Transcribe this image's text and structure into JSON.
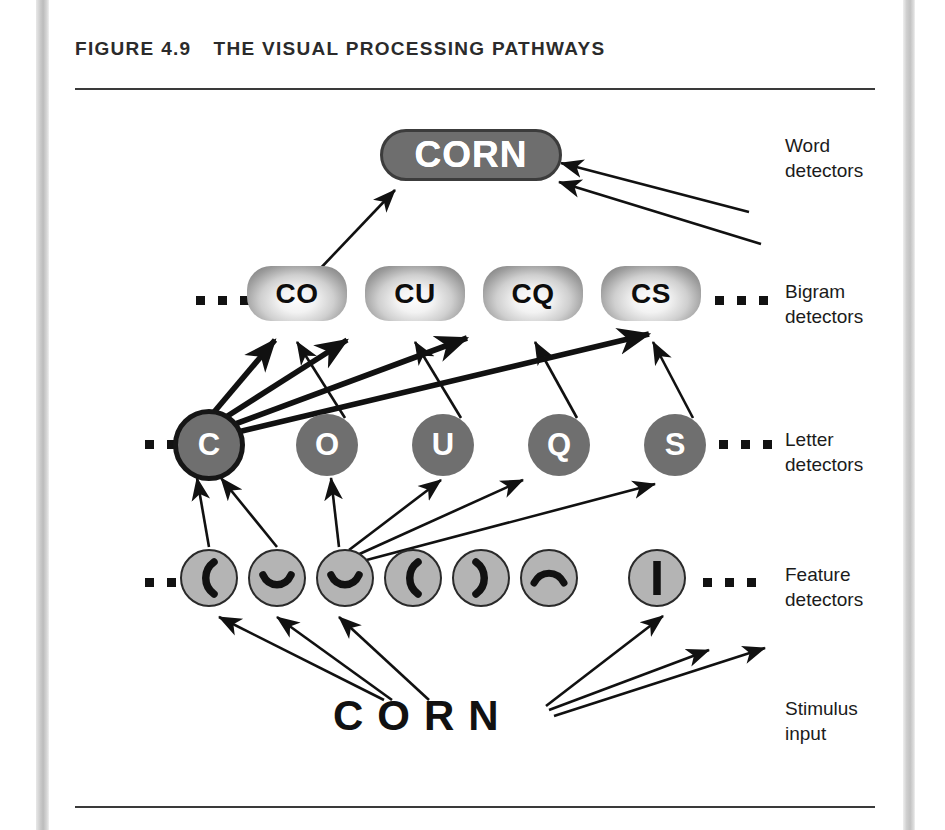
{
  "figure": {
    "number": "FIGURE 4.9",
    "title": "THE VISUAL PROCESSING PATHWAYS"
  },
  "rows": {
    "word": {
      "label": "Word\ndetectors",
      "nodes": [
        {
          "text": "CORN"
        }
      ]
    },
    "bigram": {
      "label": "Bigram\ndetectors",
      "ellipsis_left": "...",
      "ellipsis_right": "...",
      "nodes": [
        {
          "text": "CO"
        },
        {
          "text": "CU"
        },
        {
          "text": "CQ"
        },
        {
          "text": "CS"
        }
      ]
    },
    "letter": {
      "label": "Letter\ndetectors",
      "ellipsis_left": "...",
      "ellipsis_right": "...",
      "nodes": [
        {
          "text": "C",
          "highlight": true
        },
        {
          "text": "O",
          "highlight": false
        },
        {
          "text": "U",
          "highlight": false
        },
        {
          "text": "Q",
          "highlight": false
        },
        {
          "text": "S",
          "highlight": false
        }
      ]
    },
    "feature": {
      "label": "Feature\ndetectors",
      "ellipsis_left": "...",
      "ellipsis_right": "...",
      "nodes": [
        {
          "glyph": "left-paren-arc-icon"
        },
        {
          "glyph": "cup-arc-icon"
        },
        {
          "glyph": "cup-arc-icon"
        },
        {
          "glyph": "left-paren-arc-icon"
        },
        {
          "glyph": "right-paren-arc-icon"
        },
        {
          "glyph": "cap-arc-icon"
        },
        {
          "glyph": "vertical-bar-icon"
        }
      ]
    },
    "stimulus": {
      "label": "Stimulus\ninput",
      "text": "CORN"
    }
  },
  "colors": {
    "word_node_fill": "#6e6e6e",
    "word_node_border": "#3c3c3c",
    "word_node_text": "#ffffff",
    "letter_node_fill": "#6f6f6f",
    "letter_node_text": "#ffffff",
    "letter_highlight_border": "#161616",
    "feature_node_fill": "#b4b4b4",
    "feature_node_border": "#2a2a2a",
    "bigram_node_text": "#0d0d0d",
    "rule": "#3a3a3a",
    "label_text": "#1b1b1b",
    "page_background": "#ffffff"
  }
}
